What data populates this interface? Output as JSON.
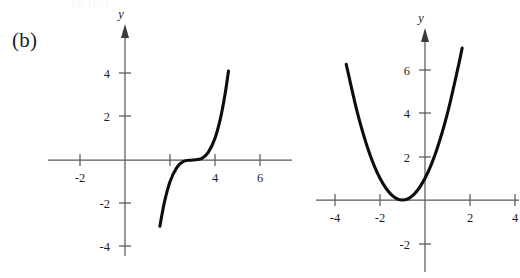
{
  "figure": {
    "panel_label": "(b)",
    "top_cut_text": "(3,  )      (  ,  )",
    "background_color": "#ffffff",
    "curve_color": "#0d0d0d",
    "axis_color": "#5a5a5a"
  },
  "chart_data": [
    {
      "type": "line",
      "id": "left-cubic",
      "title": "",
      "xlabel": "",
      "ylabel": "y",
      "y_axis_name": "y",
      "xlim": [
        -3.6,
        6.9
      ],
      "ylim": [
        -5.3,
        5.3
      ],
      "grid": false,
      "legend": "none",
      "x_ticks": [
        -2,
        2,
        4,
        6
      ],
      "x_tick_labels": [
        "-2",
        "",
        "4",
        "6"
      ],
      "x_ticks_unlabeled": [
        2
      ],
      "y_ticks": [
        4,
        2,
        -2,
        -4
      ],
      "y_tick_labels": [
        "4",
        "2",
        "-2",
        "-4"
      ],
      "equation": "y = (x - 3)^3",
      "inflection_point": [
        3,
        0
      ],
      "x_intercept": 3,
      "points": [
        {
          "x": 1.55,
          "y": -3.05
        },
        {
          "x": 1.75,
          "y": -1.95
        },
        {
          "x": 2.0,
          "y": -1.0
        },
        {
          "x": 2.3,
          "y": -0.35
        },
        {
          "x": 2.6,
          "y": -0.065
        },
        {
          "x": 3.0,
          "y": 0.0
        },
        {
          "x": 3.4,
          "y": 0.065
        },
        {
          "x": 3.7,
          "y": 0.35
        },
        {
          "x": 4.0,
          "y": 1.0
        },
        {
          "x": 4.25,
          "y": 1.95
        },
        {
          "x": 4.45,
          "y": 3.05
        },
        {
          "x": 4.6,
          "y": 4.1
        }
      ]
    },
    {
      "type": "line",
      "id": "right-parabola",
      "title": "",
      "xlabel": "",
      "ylabel": "y",
      "y_axis_name": "y",
      "xlim": [
        -4.6,
        4.7
      ],
      "ylim": [
        -2.6,
        7.5
      ],
      "grid": false,
      "legend": "none",
      "x_ticks": [
        -4,
        -2,
        2,
        4
      ],
      "x_tick_labels": [
        "-4",
        "-2",
        "2",
        "4"
      ],
      "y_ticks": [
        6,
        4,
        2,
        -2
      ],
      "y_tick_labels": [
        "6",
        "4",
        "2",
        "-2"
      ],
      "equation": "y = (x + 1)^2",
      "vertex": [
        -1,
        0
      ],
      "y_intercept": 1,
      "points": [
        {
          "x": -3.5,
          "y": 6.25
        },
        {
          "x": -3.0,
          "y": 4.0
        },
        {
          "x": -2.5,
          "y": 2.25
        },
        {
          "x": -2.0,
          "y": 1.0
        },
        {
          "x": -1.5,
          "y": 0.25
        },
        {
          "x": -1.0,
          "y": 0.0
        },
        {
          "x": -0.5,
          "y": 0.25
        },
        {
          "x": 0.0,
          "y": 1.0
        },
        {
          "x": 0.5,
          "y": 2.25
        },
        {
          "x": 1.0,
          "y": 4.0
        },
        {
          "x": 1.5,
          "y": 6.25
        },
        {
          "x": 1.65,
          "y": 7.0
        }
      ]
    }
  ]
}
